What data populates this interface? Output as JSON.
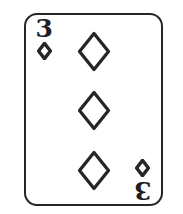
{
  "scene": {
    "width": 183,
    "height": 214,
    "background_color": "#ffffff",
    "description": "playing-card-three-of-diamonds"
  },
  "card": {
    "rank": "3",
    "suit_name": "diamonds",
    "suit_symbol": "♦",
    "ink_color": "#262626",
    "face_color": "#ffffff",
    "border_color": "#262626",
    "corner_indices": [
      {
        "position": "top-left",
        "rank": "3",
        "suit_icon": "diamond-icon",
        "rotated": false
      },
      {
        "position": "bottom-right",
        "rank": "3",
        "suit_icon": "diamond-icon",
        "rotated": true
      }
    ],
    "pips": {
      "count": 3,
      "layout": "vertical-center-column",
      "style": "outline",
      "items": [
        {
          "id": "pip-1",
          "suit_icon": "diamond-icon"
        },
        {
          "id": "pip-2",
          "suit_icon": "diamond-icon"
        },
        {
          "id": "pip-3",
          "suit_icon": "diamond-icon"
        }
      ]
    }
  }
}
